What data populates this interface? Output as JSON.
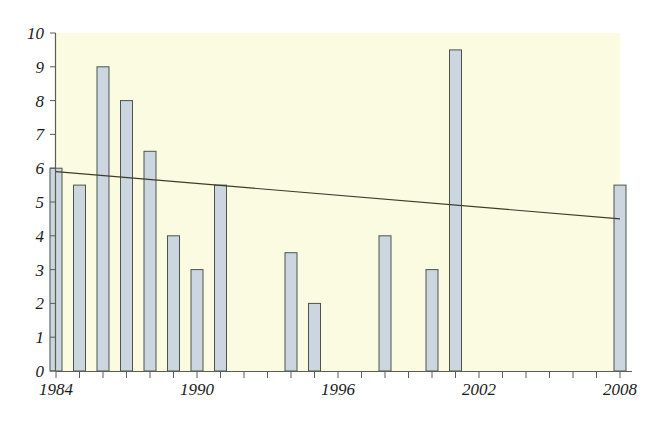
{
  "chart_data": {
    "type": "bar",
    "title": "",
    "subtitle": "",
    "xlabel": "",
    "ylabel": "",
    "xlim": [
      1984,
      2008
    ],
    "ylim": [
      0,
      10
    ],
    "grid": false,
    "legend": null,
    "plot_background_color": "#fbfbe2",
    "bar_fill_color": "#ccd6e0",
    "bar_border_color": "#4c554a",
    "axis_color": "#5a5f50",
    "trendline_color": "#3c3c28",
    "y_ticks": [
      0,
      1,
      2,
      3,
      4,
      5,
      6,
      7,
      8,
      9,
      10
    ],
    "y_tick_labels": [
      "0",
      "1",
      "2",
      "3",
      "4",
      "5",
      "6",
      "7",
      "8",
      "9",
      "10"
    ],
    "x_tick_years": [
      1984,
      1985,
      1986,
      1987,
      1988,
      1989,
      1990,
      1991,
      1992,
      1993,
      1994,
      1995,
      1996,
      1997,
      1998,
      1999,
      2000,
      2001,
      2002,
      2003,
      2004,
      2005,
      2006,
      2007,
      2008
    ],
    "x_tick_labels": [
      {
        "year": 1984,
        "label": "1984"
      },
      {
        "year": 1990,
        "label": "1990"
      },
      {
        "year": 1996,
        "label": "1996"
      },
      {
        "year": 2002,
        "label": "2002"
      },
      {
        "year": 2008,
        "label": "2008"
      }
    ],
    "categories": [
      1984,
      1985,
      1986,
      1987,
      1988,
      1989,
      1990,
      1991,
      1994,
      1995,
      1998,
      2000,
      2001,
      2008
    ],
    "values": [
      6,
      5.5,
      9,
      8,
      6.5,
      4,
      3,
      5.5,
      3.5,
      2,
      4,
      3,
      9.5,
      5.5
    ],
    "points": [
      {
        "year": 1984,
        "value": 6
      },
      {
        "year": 1985,
        "value": 5.5
      },
      {
        "year": 1986,
        "value": 9
      },
      {
        "year": 1987,
        "value": 8
      },
      {
        "year": 1988,
        "value": 6.5
      },
      {
        "year": 1989,
        "value": 4
      },
      {
        "year": 1990,
        "value": 3
      },
      {
        "year": 1991,
        "value": 5.5
      },
      {
        "year": 1994,
        "value": 3.5
      },
      {
        "year": 1995,
        "value": 2
      },
      {
        "year": 1998,
        "value": 4
      },
      {
        "year": 2000,
        "value": 3
      },
      {
        "year": 2001,
        "value": 9.5
      },
      {
        "year": 2008,
        "value": 5.5
      }
    ],
    "trendline": {
      "type": "linear",
      "start": {
        "year": 1984,
        "value": 5.9
      },
      "end": {
        "year": 2008,
        "value": 4.5
      }
    }
  }
}
